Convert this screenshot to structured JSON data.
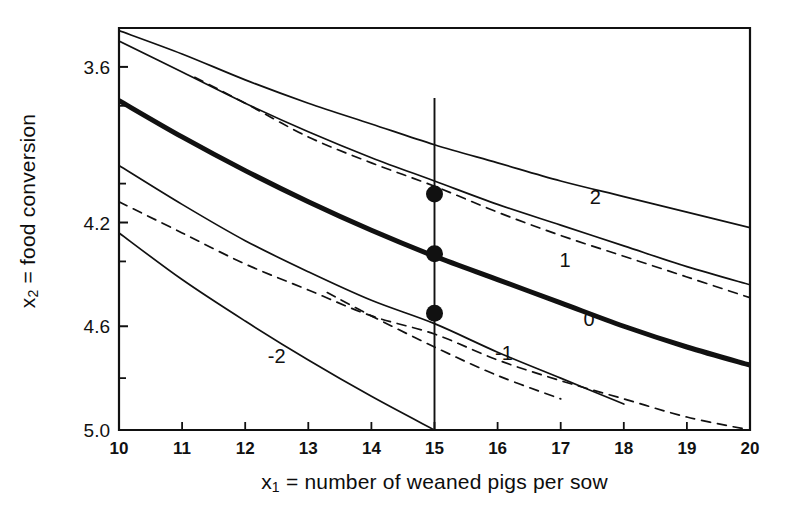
{
  "figure": {
    "kind": "contour-plot",
    "line_color": "#111111",
    "background": "#ffffff"
  },
  "chart_data": {
    "type": "line",
    "title": "",
    "subtitle": "",
    "xlabel": "x₁ = number of weaned pigs per sow",
    "ylabel": "x₂ = food conversion",
    "xlabel_parts": {
      "var": "x",
      "sub": "1",
      "text": " = number of weaned pigs per sow"
    },
    "ylabel_parts": {
      "var": "x",
      "sub": "2",
      "text": " = food conversion"
    },
    "xlim": [
      10,
      20
    ],
    "ylim_top": 3.45,
    "ylim_bottom": 5.0,
    "y_axis_inverted": true,
    "grid": false,
    "legend": "none",
    "xticks": [
      10,
      11,
      12,
      13,
      14,
      15,
      16,
      17,
      18,
      19,
      20
    ],
    "xticklabels": [
      "10",
      "11",
      "12",
      "13",
      "14",
      "15",
      "16",
      "17",
      "18",
      "19",
      "20"
    ],
    "yticks_labeled": [
      3.6,
      4.2,
      4.6,
      5.0
    ],
    "yticklabels": [
      "3.6",
      "4.2",
      "4.6",
      "5.0"
    ],
    "yticks_minor": [
      3.75,
      4.05,
      4.35,
      4.8
    ],
    "reference_line": {
      "name": "vertical-reference-x1-15",
      "orientation": "vertical",
      "x": 15,
      "label": "15"
    },
    "markers": [
      {
        "name": "intersection-contour-1",
        "x": 15,
        "y": 4.09,
        "style": "filled-circle"
      },
      {
        "name": "intersection-contour-0",
        "x": 15,
        "y": 4.32,
        "style": "filled-circle"
      },
      {
        "name": "intersection-contour-minus-1",
        "x": 15,
        "y": 4.55,
        "style": "filled-circle"
      }
    ],
    "series": [
      {
        "name": "contour-2",
        "label": "2",
        "style": "solid",
        "width": "thin",
        "label_pos": {
          "x": 17.55,
          "y": 4.13
        },
        "x": [
          10,
          11,
          12,
          13,
          14,
          15,
          16,
          17,
          18,
          19,
          20
        ],
        "y": [
          3.46,
          3.55,
          3.65,
          3.74,
          3.82,
          3.9,
          3.97,
          4.04,
          4.1,
          4.16,
          4.22
        ]
      },
      {
        "name": "contour-1",
        "label": "1",
        "style": "solid",
        "width": "thin",
        "label_pos": {
          "x": 17.07,
          "y": 4.37
        },
        "x": [
          10,
          11,
          12,
          13,
          14,
          15,
          16,
          17,
          18,
          19,
          20
        ],
        "y": [
          3.5,
          3.62,
          3.74,
          3.85,
          3.95,
          4.04,
          4.13,
          4.21,
          4.29,
          4.37,
          4.44
        ]
      },
      {
        "name": "contour-1-dashed",
        "label": "",
        "style": "dashed",
        "width": "thin",
        "x": [
          11.2,
          12,
          13,
          14,
          15,
          16,
          17,
          18,
          19,
          20
        ],
        "y": [
          3.64,
          3.74,
          3.87,
          3.97,
          4.06,
          4.16,
          4.25,
          4.33,
          4.41,
          4.49
        ]
      },
      {
        "name": "contour-0",
        "label": "0",
        "style": "solid",
        "width": "thick",
        "label_pos": {
          "x": 17.45,
          "y": 4.6
        },
        "x": [
          10,
          11,
          12,
          13,
          14,
          15,
          16,
          17,
          18,
          19,
          20
        ],
        "y": [
          3.73,
          3.87,
          4.0,
          4.12,
          4.23,
          4.33,
          4.42,
          4.51,
          4.6,
          4.68,
          4.75
        ]
      },
      {
        "name": "contour-minus-1",
        "label": "-1",
        "style": "solid",
        "width": "thin",
        "label_pos": {
          "x": 16.1,
          "y": 4.73
        },
        "x": [
          10,
          11,
          12,
          13,
          14,
          15,
          16,
          17,
          18
        ],
        "y": [
          3.98,
          4.13,
          4.27,
          4.39,
          4.5,
          4.59,
          4.7,
          4.8,
          4.9
        ]
      },
      {
        "name": "contour-minus-1-dashed",
        "label": "",
        "style": "dashed",
        "width": "thin",
        "x": [
          10,
          11,
          12,
          13,
          14,
          15,
          16,
          17,
          18,
          19,
          20
        ],
        "y": [
          4.12,
          4.24,
          4.36,
          4.46,
          4.56,
          4.63,
          4.73,
          4.81,
          4.88,
          4.95,
          5.0
        ]
      },
      {
        "name": "contour-minus-2",
        "label": "-2",
        "style": "solid",
        "width": "thin",
        "label_pos": {
          "x": 12.5,
          "y": 4.74
        },
        "x": [
          10,
          11,
          12,
          13,
          14,
          15
        ],
        "y": [
          4.24,
          4.42,
          4.58,
          4.73,
          4.87,
          5.0
        ]
      },
      {
        "name": "contour-minus-2-dashed",
        "label": "",
        "style": "dashed",
        "width": "thin",
        "x": [
          13.3,
          14,
          15,
          16,
          17
        ],
        "y": [
          4.47,
          4.56,
          4.68,
          4.79,
          4.88
        ]
      }
    ]
  }
}
